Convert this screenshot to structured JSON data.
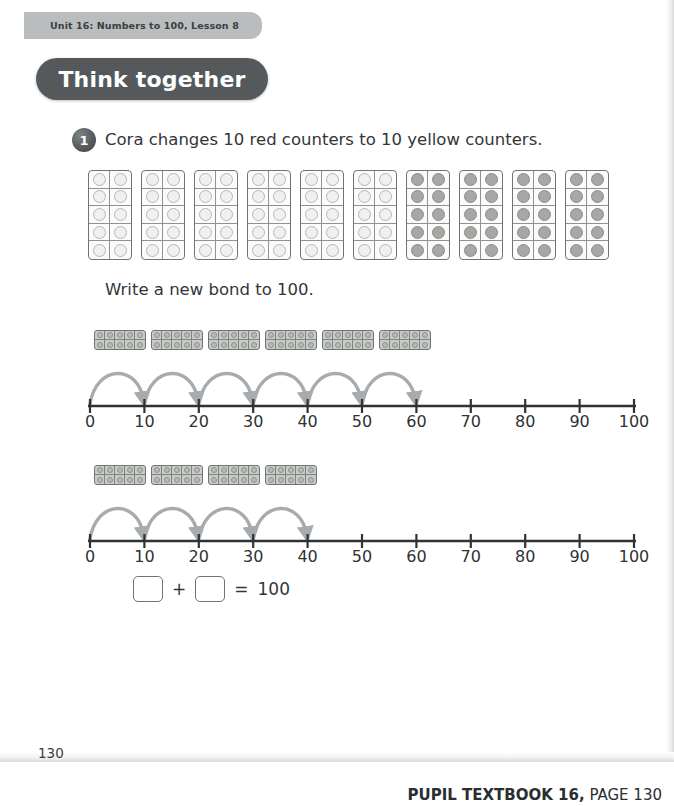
{
  "header": {
    "unit_tab": "Unit 16: Numbers to 100, Lesson 8",
    "banner_label": "Think together"
  },
  "question": {
    "number": "1",
    "prompt": "Cora changes 10 red counters to 10 yellow counters.",
    "instruction": "Write a new bond to 100."
  },
  "counters": {
    "total_frames": 10,
    "red_frames": 6,
    "yellow_frames": 4,
    "counters_per_frame": 10,
    "red_total": 60,
    "yellow_total": 40,
    "red_label": "red",
    "yellow_label": "yellow"
  },
  "numberlines": [
    {
      "id": "numberline-red",
      "strip_frames": 6,
      "jumps": 6,
      "jump_size": 10,
      "start": 0,
      "end": 60,
      "ticks": [
        "0",
        "10",
        "20",
        "30",
        "40",
        "50",
        "60",
        "70",
        "80",
        "90",
        "100"
      ],
      "min": 0,
      "max": 100,
      "step": 10
    },
    {
      "id": "numberline-yellow",
      "strip_frames": 4,
      "jumps": 4,
      "jump_size": 10,
      "start": 0,
      "end": 40,
      "ticks": [
        "0",
        "10",
        "20",
        "30",
        "40",
        "50",
        "60",
        "70",
        "80",
        "90",
        "100"
      ],
      "min": 0,
      "max": 100,
      "step": 10
    }
  ],
  "equation": {
    "first_box_value": "",
    "plus": "+",
    "second_box_value": "",
    "equals": "=",
    "total": "100"
  },
  "footer": {
    "page_number": "130",
    "source_bold": "PUPIL TEXTBOOK 16,",
    "source_rest": " PAGE 130"
  },
  "colors": {
    "tab_bg": "#b9bdbe",
    "banner_bg": "#55595b",
    "text": "#333638",
    "arrow": "#a8abad",
    "frame_border": "#6f7476",
    "counter_light": "#f0f0ee",
    "counter_dark": "#a6a8a4"
  }
}
